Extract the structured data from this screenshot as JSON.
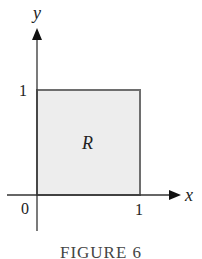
{
  "figure": {
    "caption": "FIGURE 6",
    "region_label": "R",
    "x_axis_label": "x",
    "y_axis_label": "y",
    "origin_label": "0",
    "x_tick_label": "1",
    "y_tick_label": "1",
    "colors": {
      "region_fill": "#ededed",
      "region_stroke": "#6e6e6e",
      "axis": "#333333"
    }
  }
}
